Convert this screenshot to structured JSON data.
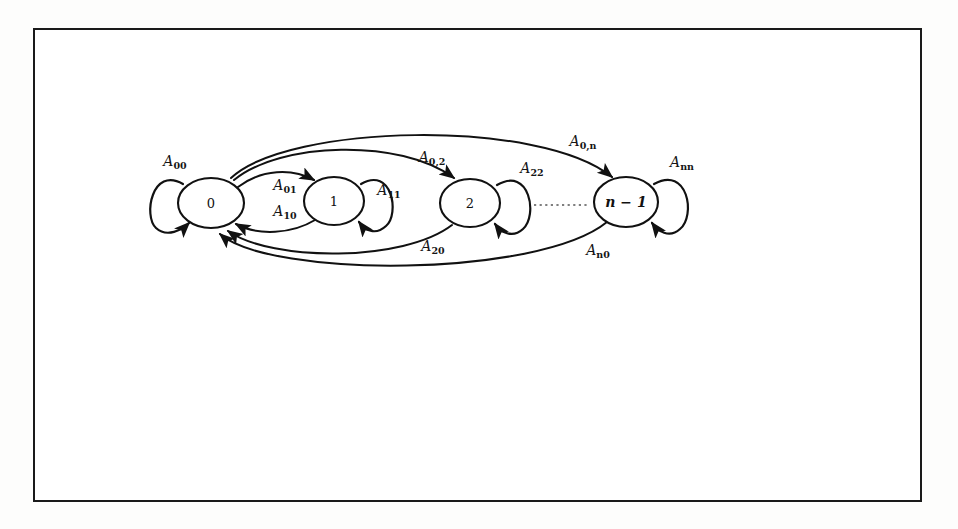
{
  "figure": {
    "kind": "state-transition-diagram",
    "background_color": "#ffffff",
    "frame_color": "#1a1a1a",
    "ink_color": "#111111"
  },
  "nodes": [
    {
      "id": "s0",
      "label": "0",
      "cx": 211,
      "cy": 203,
      "rx": 33,
      "ry": 25
    },
    {
      "id": "s1",
      "label": "1",
      "cx": 334,
      "cy": 201,
      "rx": 30,
      "ry": 24
    },
    {
      "id": "s2",
      "label": "2",
      "cx": 470,
      "cy": 203,
      "rx": 30,
      "ry": 24
    },
    {
      "id": "sn",
      "label": "n − 1",
      "cx": 626,
      "cy": 202,
      "rx": 32,
      "ry": 25
    }
  ],
  "self_loops": [
    {
      "id": "loop00",
      "label_base": "A",
      "label_sub": "00",
      "node": "s0",
      "side": "left",
      "label_x": 175,
      "label_y": 162
    },
    {
      "id": "loop11",
      "label_base": "A",
      "label_sub": "11",
      "node": "s1",
      "side": "right",
      "label_x": 389,
      "label_y": 191
    },
    {
      "id": "loop22",
      "label_base": "A",
      "label_sub": "22",
      "node": "s2",
      "side": "right",
      "label_x": 532,
      "label_y": 169
    },
    {
      "id": "loopnn",
      "label_base": "A",
      "label_sub": "nn",
      "node": "sn",
      "side": "right",
      "label_x": 682,
      "label_y": 163
    }
  ],
  "edges": [
    {
      "id": "e01",
      "from": "s0",
      "to": "s1",
      "label_base": "A",
      "label_sub": "01",
      "direction": "forward",
      "label_x": 285,
      "label_y": 186
    },
    {
      "id": "e10",
      "from": "s1",
      "to": "s0",
      "label_base": "A",
      "label_sub": "10",
      "direction": "reverse",
      "label_x": 285,
      "label_y": 212
    },
    {
      "id": "e02",
      "from": "s0",
      "to": "s2",
      "label_base": "A",
      "label_sub": "0,2",
      "direction": "forward",
      "label_x": 432,
      "label_y": 158
    },
    {
      "id": "e20",
      "from": "s2",
      "to": "s0",
      "label_base": "A",
      "label_sub": "20",
      "direction": "reverse",
      "label_x": 433,
      "label_y": 247
    },
    {
      "id": "e0n",
      "from": "s0",
      "to": "sn",
      "label_base": "A",
      "label_sub": "0,n",
      "direction": "forward",
      "label_x": 583,
      "label_y": 142
    },
    {
      "id": "en0",
      "from": "sn",
      "to": "s0",
      "label_base": "A",
      "label_sub": "n0",
      "direction": "reverse",
      "label_x": 598,
      "label_y": 251
    }
  ],
  "ellipsis": {
    "id": "dots-between-2-and-n",
    "text": "......",
    "x1": 532,
    "x2": 586,
    "y": 205
  }
}
